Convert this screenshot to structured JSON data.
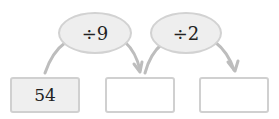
{
  "operations": [
    {
      "label": "÷9"
    },
    {
      "label": "÷2"
    }
  ],
  "boxes": [
    {
      "value": "54"
    },
    {
      "value": ""
    },
    {
      "value": ""
    }
  ],
  "colors": {
    "line": "#bdbdbd",
    "ellipse_fill": "#eeeeee",
    "start_box_fill": "#efefef"
  }
}
